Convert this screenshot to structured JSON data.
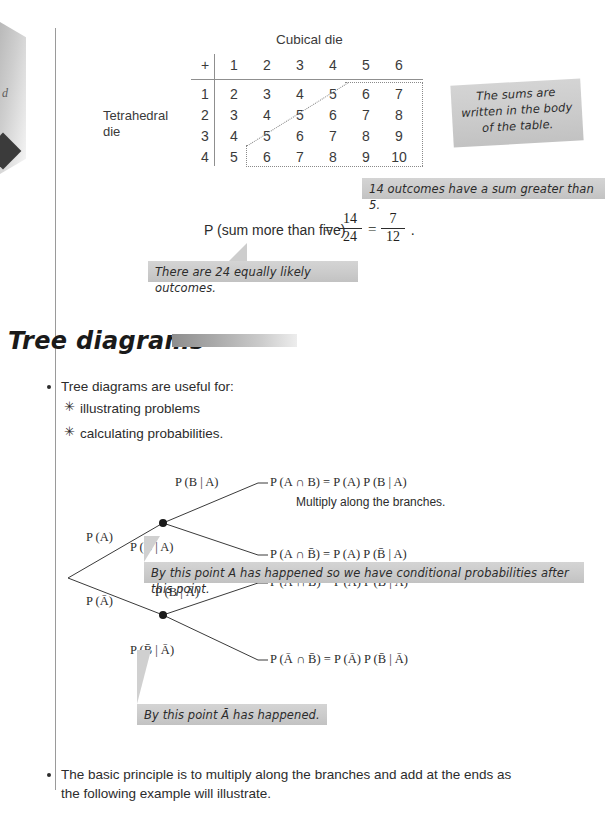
{
  "edge": {
    "letter": "d",
    "marker_icon": "diamond-marker"
  },
  "table": {
    "column_caption": "Cubical die",
    "row_caption_line1": "Tetrahedral",
    "row_caption_line2": "die",
    "corner_symbol": "+",
    "column_headers": [
      "1",
      "2",
      "3",
      "4",
      "5",
      "6"
    ],
    "row_headers": [
      "1",
      "2",
      "3",
      "4"
    ],
    "rows": [
      [
        "2",
        "3",
        "4",
        "5",
        "6",
        "7"
      ],
      [
        "3",
        "4",
        "5",
        "6",
        "7",
        "8"
      ],
      [
        "4",
        "5",
        "6",
        "7",
        "8",
        "9"
      ],
      [
        "5",
        "6",
        "7",
        "8",
        "9",
        "10"
      ]
    ]
  },
  "callouts": {
    "sums_body": "The sums are\nwritten in the body\nof the table.",
    "fourteen_outcomes": "14 outcomes have a sum greater than 5.",
    "twentyfour_outcomes": "There are 24 equally likely outcomes.",
    "conditional_after": "By this point A has happened so we have conditional probabilities after this point.",
    "abar_happened": "By this point Ā has happened."
  },
  "probability": {
    "label": "P (sum more than five)",
    "equals1": "=",
    "frac1_num": "14",
    "frac1_den": "24",
    "equals2": "=",
    "frac2_num": "7",
    "frac2_den": "12",
    "period": "."
  },
  "section": {
    "heading": "Tree diagrams"
  },
  "bullets": {
    "intro": "Tree diagrams are useful for:",
    "sub1": "illustrating problems",
    "sub2": "calculating probabilities.",
    "sub_marker": "✳",
    "closing_line1": "The basic principle is to multiply along the branches and add at the ends as",
    "closing_line2": "the following example will illustrate."
  },
  "tree": {
    "branch_pa": "P (A)",
    "branch_pabar": "P (Ā)",
    "branch_b_given_a": "P (B | A)",
    "branch_bbar_given_a": "P (B̄ | A)",
    "branch_b_given_abar": "P (B | Ā)",
    "branch_bbar_given_abar": "P (B̄ | Ā)",
    "outcome_1": "P (A ∩ B) = P (A) P (B | A)",
    "outcome_2": "P (A ∩ B̄) = P (A) P (B̄ | A)",
    "outcome_3": "P (Ā ∩ B) = P (Ā) P (B | Ā)",
    "outcome_4": "P (Ā ∩ B̄) = P (Ā) P (B̄ | Ā)",
    "multiply_note": "Multiply along the branches."
  },
  "colors": {
    "ink": "#231f20",
    "rule": "#8f8f8f",
    "callout_bg": "#cbcbcb",
    "heading_bar": "#8e8e8e"
  }
}
